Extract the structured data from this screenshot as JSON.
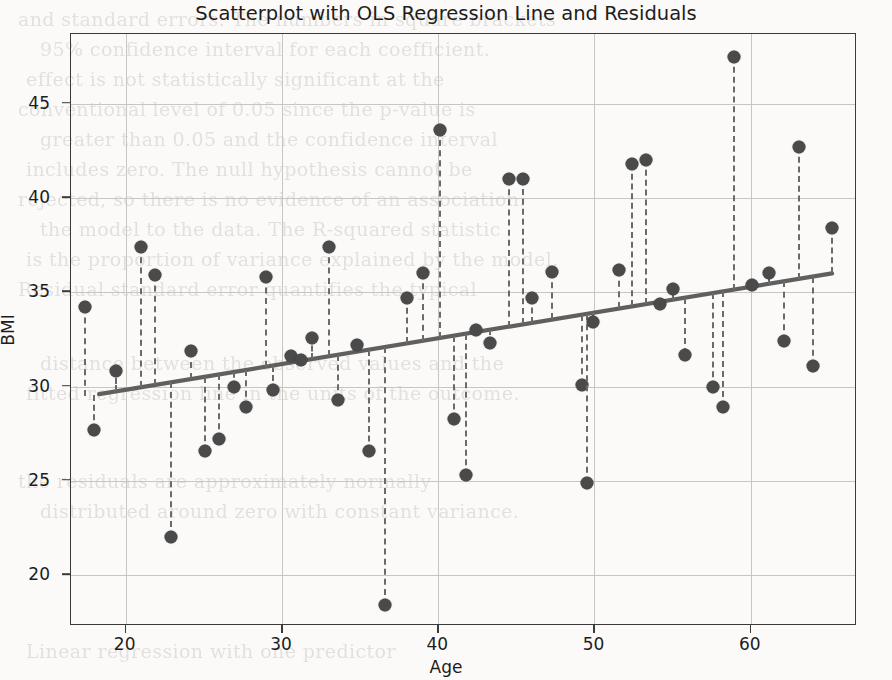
{
  "figure": {
    "title": "Scatterplot with OLS Regression Line and Residuals",
    "xlabel": "Age",
    "ylabel": "BMI"
  },
  "style": {
    "point_color": "#4a4a4a",
    "line_color": "#5f5f5f",
    "residual_color": "#6a6a6a",
    "grid_color": "#c9c5c0",
    "axis_color": "#3a3a3a"
  },
  "chart_data": {
    "type": "scatter",
    "title": "Scatterplot with OLS Regression Line and Residuals",
    "xlabel": "Age",
    "ylabel": "BMI",
    "xlim": [
      16.5,
      66.8
    ],
    "ylim": [
      17.3,
      48.7
    ],
    "xticks": [
      20,
      30,
      40,
      50,
      60
    ],
    "yticks": [
      20,
      25,
      30,
      35,
      40,
      45
    ],
    "grid": true,
    "legend": null,
    "regression_line": {
      "label": "OLS Regression Line",
      "x_start": 18.3,
      "y_start": 29.6,
      "x_end": 65.2,
      "y_end": 36.0,
      "slope": 0.1365,
      "intercept": 27.1
    },
    "residuals_shown": true,
    "points": [
      {
        "x": 17.4,
        "y": 34.2
      },
      {
        "x": 18.0,
        "y": 27.7
      },
      {
        "x": 19.4,
        "y": 30.8
      },
      {
        "x": 21.0,
        "y": 37.4
      },
      {
        "x": 21.9,
        "y": 35.9
      },
      {
        "x": 22.9,
        "y": 22.0
      },
      {
        "x": 24.2,
        "y": 31.9
      },
      {
        "x": 25.1,
        "y": 26.6
      },
      {
        "x": 26.0,
        "y": 27.2
      },
      {
        "x": 26.9,
        "y": 30.0
      },
      {
        "x": 27.7,
        "y": 28.9
      },
      {
        "x": 29.0,
        "y": 35.8
      },
      {
        "x": 29.4,
        "y": 29.8
      },
      {
        "x": 30.6,
        "y": 31.6
      },
      {
        "x": 31.2,
        "y": 31.4
      },
      {
        "x": 31.9,
        "y": 32.6
      },
      {
        "x": 33.0,
        "y": 37.4
      },
      {
        "x": 33.6,
        "y": 29.3
      },
      {
        "x": 34.8,
        "y": 32.2
      },
      {
        "x": 35.6,
        "y": 26.6
      },
      {
        "x": 36.6,
        "y": 18.4
      },
      {
        "x": 38.0,
        "y": 34.7
      },
      {
        "x": 39.0,
        "y": 36.0
      },
      {
        "x": 40.1,
        "y": 43.6
      },
      {
        "x": 41.0,
        "y": 28.3
      },
      {
        "x": 41.8,
        "y": 25.3
      },
      {
        "x": 42.4,
        "y": 33.0
      },
      {
        "x": 43.3,
        "y": 32.3
      },
      {
        "x": 44.5,
        "y": 41.0
      },
      {
        "x": 45.4,
        "y": 41.0
      },
      {
        "x": 46.0,
        "y": 34.7
      },
      {
        "x": 47.3,
        "y": 36.1
      },
      {
        "x": 49.2,
        "y": 30.1
      },
      {
        "x": 49.5,
        "y": 24.9
      },
      {
        "x": 49.9,
        "y": 33.4
      },
      {
        "x": 51.6,
        "y": 36.2
      },
      {
        "x": 52.4,
        "y": 41.8
      },
      {
        "x": 53.3,
        "y": 42.0
      },
      {
        "x": 54.2,
        "y": 34.4
      },
      {
        "x": 55.0,
        "y": 35.2
      },
      {
        "x": 55.8,
        "y": 31.7
      },
      {
        "x": 57.6,
        "y": 30.0
      },
      {
        "x": 58.2,
        "y": 28.9
      },
      {
        "x": 58.9,
        "y": 47.5
      },
      {
        "x": 60.1,
        "y": 35.4
      },
      {
        "x": 61.2,
        "y": 36.0
      },
      {
        "x": 62.1,
        "y": 32.4
      },
      {
        "x": 63.1,
        "y": 42.7
      },
      {
        "x": 64.0,
        "y": 31.1
      },
      {
        "x": 65.2,
        "y": 38.4
      }
    ]
  },
  "background_text": {
    "lines": [
      "and standard errors. The numbers in square brackets",
      "95% confidence interval for each coefficient.",
      "effect is not statistically significant at the",
      "conventional level of 0.05 since the p-value is",
      "greater than 0.05 and the confidence interval",
      "includes zero. The null hypothesis cannot be",
      "rejected, so there is no evidence of an association.",
      "the model to the data. The R-squared statistic",
      "is the proportion of variance explained by the model.",
      "Residual standard error quantifies the typical",
      "distance between the observed values and the",
      "fitted regression line in the units of the outcome.",
      "the residuals are approximately normally",
      "distributed around zero with constant variance.",
      "Linear regression with one predictor"
    ]
  }
}
